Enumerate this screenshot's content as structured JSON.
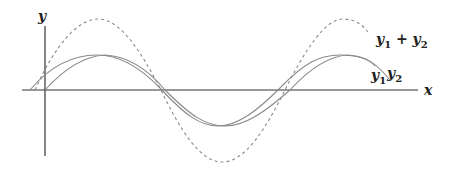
{
  "diagram": {
    "axes": {
      "x_label": "x",
      "y_label": "y"
    },
    "curves": [
      {
        "name": "y1",
        "label": "y1",
        "style": "solid",
        "color": "#8a8a8a"
      },
      {
        "name": "y2",
        "label": "y2",
        "style": "solid",
        "color": "#8a8a8a"
      },
      {
        "name": "sum",
        "label": "y1 + y2",
        "style": "dashed",
        "color": "#8a8a8a"
      }
    ],
    "labels": {
      "sum": {
        "a": "y",
        "a_sub": "1",
        "op": " + ",
        "b": "y",
        "b_sub": "2"
      },
      "y1": {
        "a": "y",
        "a_sub": "1"
      },
      "y2": {
        "a": "y",
        "a_sub": "2"
      }
    }
  }
}
